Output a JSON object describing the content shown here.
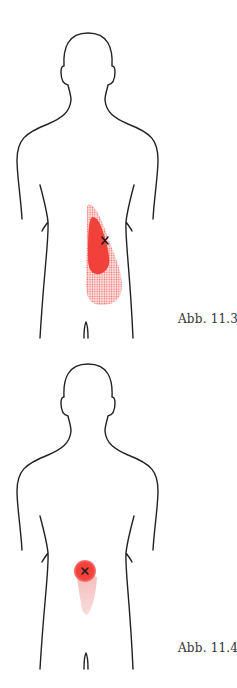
{
  "figures": [
    {
      "caption": "Abb. 11.3",
      "subject": "human-back-outline",
      "pain_pattern": "primary zone along right lumbar region with dotted spillover zone below",
      "trigger_point": "x-marker",
      "colors": {
        "primary": "#f2413b",
        "spillover": "#f7a4a2",
        "outline": "#222222"
      }
    },
    {
      "caption": "Abb. 11.4",
      "subject": "human-back-outline",
      "pain_pattern": "circular zone at lumbar midline with faint tapering spillover below",
      "trigger_point": "x-marker",
      "colors": {
        "primary": "#f2413b",
        "spillover": "#f6c6c6",
        "outline": "#222222"
      }
    }
  ]
}
